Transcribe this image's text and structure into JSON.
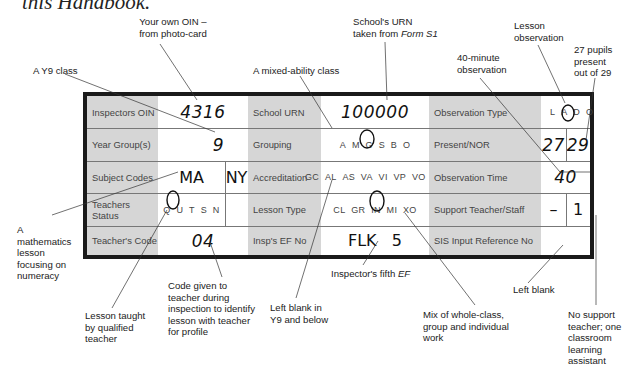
{
  "heading_fragment": "this Handbook.",
  "form": {
    "rows": [
      {
        "col1": {
          "label": "Inspectors OIN",
          "value": "4316"
        },
        "col2": {
          "label": "School URN",
          "value": "100000"
        },
        "col3": {
          "label": "Observation Type",
          "options": [
            "L",
            "A",
            "D",
            "O"
          ],
          "selected": "L"
        }
      },
      {
        "col1": {
          "label": "Year Group(s)",
          "value": "9"
        },
        "col2": {
          "label": "Grouping",
          "options": [
            "A",
            "M",
            "G",
            "S",
            "B",
            "O"
          ],
          "selected": "M"
        },
        "col3": {
          "label": "Present/NOR",
          "present": "27",
          "nor": "29"
        }
      },
      {
        "col1": {
          "label": "Subject Codes",
          "value": "MA",
          "value2": "NY"
        },
        "col2": {
          "label": "Accreditation",
          "options": [
            "GC",
            "AL",
            "AS",
            "VA",
            "VI",
            "VP",
            "VO",
            "XO"
          ],
          "selected": ""
        },
        "col3": {
          "label": "Observation Time",
          "value": "40"
        }
      },
      {
        "col1": {
          "label": "Teachers Status",
          "options": [
            "Q",
            "U",
            "T",
            "S",
            "N"
          ],
          "selected": "Q"
        },
        "col2": {
          "label": "Lesson Type",
          "options": [
            "CL",
            "GR",
            "IN",
            "MI",
            "XO"
          ],
          "selected": "MI"
        },
        "col3": {
          "label": "Support Teacher/Staff",
          "teacher": "–",
          "staff": "1"
        }
      },
      {
        "col1": {
          "label": "Teacher's Code",
          "value": "04"
        },
        "col2": {
          "label": "Insp's EF No",
          "value": "FLK   5"
        },
        "col3": {
          "label": "SIS Input Reference No",
          "value": ""
        }
      }
    ]
  },
  "annotations": {
    "oin": "Your own OIN – from photo-card",
    "urn_prefix": "School's URN taken from ",
    "urn_form": "Form S1",
    "y9": "A Y9 class",
    "mixed": "A mixed-ability class",
    "lesson_obs": "Lesson observation",
    "obs40": "40-minute observation",
    "pupils": "27 pupils present out of 29",
    "maths": "A mathematics lesson focusing on numeracy",
    "qualified": "Lesson taught by qualified teacher",
    "code": "Code given to teacher during inspection to identify lesson with teacher for profile",
    "blank_y9": "Left blank in Y9 and below",
    "ef_prefix": "Inspector's fifth ",
    "ef_italic": "EF",
    "mix": "Mix of whole-class, group and individual work",
    "left_blank": "Left blank",
    "support": "No support teacher; one classroom learning assistant"
  }
}
